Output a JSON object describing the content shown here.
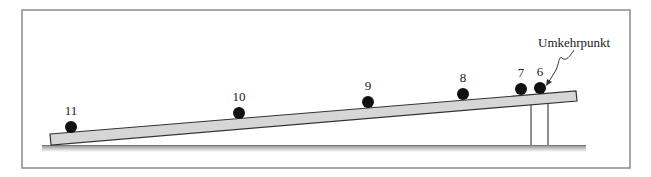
{
  "figure": {
    "annotation": "Umkehrpunkt",
    "colors": {
      "frame": "#8a8a8a",
      "ramp_fill": "#d6d6d6",
      "ramp_stroke": "#333333",
      "ball": "#111111",
      "ground": "#9a9a9a",
      "text": "#222222"
    },
    "balls": [
      {
        "label": "11",
        "cx": 71,
        "cy": 127
      },
      {
        "label": "10",
        "cx": 239,
        "cy": 113
      },
      {
        "label": "9",
        "cx": 368,
        "cy": 102
      },
      {
        "label": "8",
        "cx": 463,
        "cy": 94
      },
      {
        "label": "7",
        "cx": 521,
        "cy": 89
      },
      {
        "label": "6",
        "cx": 540,
        "cy": 88
      }
    ]
  }
}
